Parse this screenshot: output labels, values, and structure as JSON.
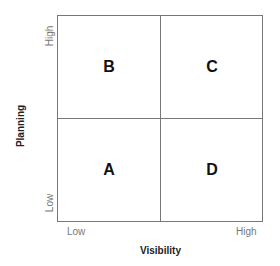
{
  "diagram": {
    "type": "2x2 quadrant matrix",
    "x_axis": {
      "title": "Visibility",
      "low_label": "Low",
      "high_label": "High"
    },
    "y_axis": {
      "title": "Planning",
      "low_label": "Low",
      "high_label": "High"
    },
    "quadrants": {
      "top_left": "B",
      "top_right": "C",
      "bottom_left": "A",
      "bottom_right": "D"
    },
    "colors": {
      "border": "#777777",
      "label": "#111111",
      "tick": "#777777"
    }
  }
}
